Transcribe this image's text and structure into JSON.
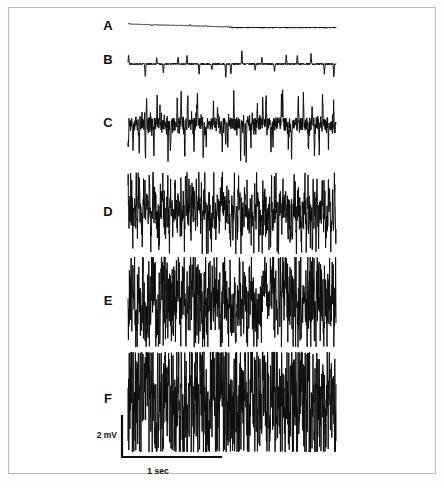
{
  "figure": {
    "kind": "emg-recruitment-traces",
    "background_color": "#ffffff",
    "border_color": "#b9b9b9",
    "trace_color": "#0d0d0d",
    "label_color": "#101010"
  },
  "scale_bar": {
    "vertical_label": "2 mV",
    "horizontal_label": "1 sec",
    "vertical_value": 2,
    "vertical_unit": "mV",
    "horizontal_value": 1,
    "horizontal_unit": "sec",
    "origin_x": 122,
    "origin_y": 457,
    "vertical_px": 42,
    "horizontal_px": 100
  },
  "chart_data": {
    "type": "line",
    "title": "",
    "subtitle": "",
    "xlabel": "1 sec",
    "ylabel": "2 mV",
    "grid": false,
    "legend": "none",
    "x_range_sec": [
      0,
      2.08
    ],
    "trace_left_px": 128,
    "trace_right_px": 336,
    "series": [
      {
        "name": "A",
        "label": "A",
        "label_x": 108,
        "label_y": 27,
        "baseline_y": 24,
        "amplitude_mv": 0.12,
        "half_height_px": 3,
        "spike_count": 11,
        "spike_gain": 0.55,
        "noise": 0.05,
        "density": 0.04,
        "stroke_width": 1.0,
        "baseline_tilt_px": 6,
        "seed": 11,
        "recruitment": "single motor unit, near-flat baseline"
      },
      {
        "name": "B",
        "label": "B",
        "label_x": 108,
        "label_y": 61,
        "baseline_y": 64,
        "amplitude_mv": 0.5,
        "half_height_px": 14,
        "spike_count": 19,
        "spike_gain": 1.0,
        "noise": 0.1,
        "density": 0.1,
        "stroke_width": 1.0,
        "baseline_tilt_px": 0,
        "seed": 23,
        "recruitment": "regular discrete motor unit spikes"
      },
      {
        "name": "C",
        "label": "C",
        "label_x": 108,
        "label_y": 124,
        "baseline_y": 124,
        "amplitude_mv": 1.3,
        "half_height_px": 38,
        "spike_count": 46,
        "spike_gain": 1.0,
        "noise": 0.28,
        "density": 0.34,
        "stroke_width": 1.0,
        "baseline_tilt_px": 0,
        "seed": 37,
        "recruitment": "several motor units, distinct spikes"
      },
      {
        "name": "D",
        "label": "D",
        "label_x": 108,
        "label_y": 213,
        "baseline_y": 213,
        "amplitude_mv": 1.7,
        "half_height_px": 40,
        "spike_count": 150,
        "spike_gain": 0.95,
        "noise": 0.52,
        "density": 0.66,
        "stroke_width": 1.0,
        "baseline_tilt_px": 0,
        "seed": 53,
        "recruitment": "increasing interference pattern"
      },
      {
        "name": "E",
        "label": "E",
        "label_x": 108,
        "label_y": 302,
        "baseline_y": 302,
        "amplitude_mv": 1.9,
        "half_height_px": 44,
        "spike_count": 280,
        "spike_gain": 0.95,
        "noise": 0.72,
        "density": 0.84,
        "stroke_width": 1.0,
        "baseline_tilt_px": 0,
        "seed": 71,
        "recruitment": "dense interference pattern"
      },
      {
        "name": "F",
        "label": "F",
        "label_x": 108,
        "label_y": 400,
        "baseline_y": 402,
        "amplitude_mv": 2.2,
        "half_height_px": 49,
        "spike_count": 470,
        "spike_gain": 1.0,
        "noise": 0.92,
        "density": 0.97,
        "stroke_width": 1.0,
        "baseline_tilt_px": 0,
        "seed": 97,
        "recruitment": "full saturated interference pattern"
      }
    ]
  }
}
